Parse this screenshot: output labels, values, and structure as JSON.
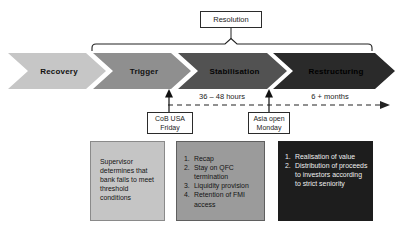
{
  "resolution_label": "Resolution",
  "phases": [
    {
      "label": "Recovery",
      "fill": "#c6c6c6",
      "text_color": "#111111"
    },
    {
      "label": "Trigger",
      "fill": "#8f8f8f",
      "text_color": "#111111"
    },
    {
      "label": "Stabilisation",
      "fill": "#525252",
      "text_color": "#050505"
    },
    {
      "label": "Restructuring",
      "fill": "#2a2a2a",
      "text_color": "#000000"
    }
  ],
  "timeline": {
    "interval_short": "36 – 48 hours",
    "interval_long": "6 + months"
  },
  "milestones": [
    {
      "line1": "CoB USA",
      "line2": "Friday"
    },
    {
      "line1": "Asia open",
      "line2": "Monday"
    }
  ],
  "detail_boxes": [
    {
      "bg": "#c5c5c5",
      "fg": "#141414",
      "text": "Supervisor determines that bank fails to meet threshold conditions"
    },
    {
      "bg": "#9b9b9b",
      "fg": "#141414",
      "items": [
        {
          "num": "1.",
          "text": "Recap"
        },
        {
          "num": "2.",
          "text": "Stay on QFC termination"
        },
        {
          "num": "3.",
          "text": "Liquidity provision"
        },
        {
          "num": "4.",
          "text": "Retention of FMI access"
        }
      ]
    },
    {
      "bg": "#1d1d1d",
      "fg": "#efefef",
      "items": [
        {
          "num": "1.",
          "text": "Realisation of value"
        },
        {
          "num": "2.",
          "text": "Distribution of proceeds to investors according to strict seniority"
        }
      ]
    }
  ],
  "line_color": "#222222"
}
